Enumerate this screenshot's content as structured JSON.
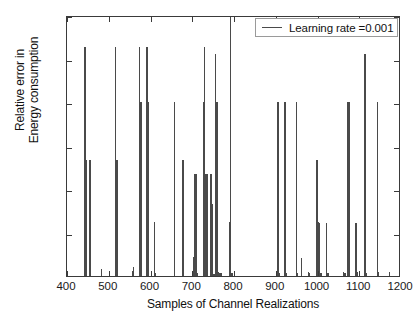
{
  "chart_data": {
    "type": "bar",
    "title": "",
    "xlabel": "Samples of Channel Realizations",
    "ylabel_line1": "Relative error in",
    "ylabel_line2": "Energy consumption",
    "xlim": [
      400,
      1200
    ],
    "ylim": [
      0,
      3
    ],
    "xticks": [
      400,
      500,
      600,
      700,
      800,
      900,
      1000,
      1100,
      1200
    ],
    "xtick_labels": [
      "400",
      "500",
      "600",
      "700",
      "800",
      "900",
      "1000",
      "1100",
      "1200"
    ],
    "yticks": [
      0,
      0.5,
      1,
      1.5,
      2,
      2.5,
      3
    ],
    "ytick_labels": [
      "0",
      "0.5",
      "1",
      "1.5",
      "2",
      "2.5",
      "3"
    ],
    "grid": false,
    "legend_position": "top-right",
    "series": [
      {
        "name": "Learning rate =0.001",
        "color": "#4a4a4a",
        "x": [
          443,
          446,
          455,
          482,
          516,
          520,
          557,
          559,
          574,
          577,
          592,
          595,
          609,
          611,
          657,
          678,
          703,
          706,
          709,
          712,
          727,
          729,
          731,
          733,
          736,
          745,
          748,
          752,
          756,
          759,
          762,
          765,
          769,
          789,
          792,
          795,
          905,
          908,
          922,
          925,
          949,
          952,
          962,
          979,
          981,
          999,
          1002,
          1005,
          1008,
          1022,
          1025,
          1063,
          1066,
          1073,
          1076,
          1092,
          1095,
          1114,
          1117,
          1143,
          1146,
          1173
        ],
        "values": [
          2.63,
          1.33,
          1.33,
          0.08,
          2.63,
          1.33,
          0.06,
          0.1,
          2.63,
          2.0,
          2.63,
          2.0,
          0.62,
          0.03,
          2.0,
          1.33,
          0.22,
          1.17,
          1.17,
          0.04,
          2.0,
          2.63,
          1.17,
          1.17,
          1.17,
          1.17,
          0.83,
          0.02,
          2.55,
          2.0,
          0.05,
          0.04,
          0.04,
          0.62,
          3.0,
          0.03,
          2.0,
          0.03,
          2.0,
          0.04,
          2.0,
          0.04,
          0.21,
          0.05,
          0.03,
          1.33,
          0.62,
          0.61,
          0.04,
          0.61,
          0.03,
          0.05,
          0.04,
          2.0,
          2.0,
          0.61,
          0.05,
          2.55,
          0.04,
          2.0,
          0.05,
          0.05
        ]
      }
    ]
  },
  "legend": {
    "entries": [
      {
        "label": "Learning rate =0.001",
        "color": "#4a4a4a"
      }
    ]
  },
  "axes": {
    "line_color": "#3a3a3a",
    "background": "#ffffff"
  }
}
